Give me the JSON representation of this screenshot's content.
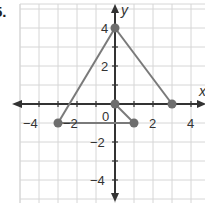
{
  "problem_number": "5.",
  "chart_data": {
    "type": "scatter",
    "title": "",
    "xlabel": "x",
    "ylabel": "y",
    "xlim": [
      -5,
      5
    ],
    "ylim": [
      -5,
      5
    ],
    "grid": true,
    "x_tick_labels": [
      "-4",
      "-2",
      "0",
      "2",
      "4"
    ],
    "y_tick_labels": [
      "4",
      "2",
      "-2",
      "-4"
    ],
    "points": [
      {
        "x": 0,
        "y": 4
      },
      {
        "x": 3,
        "y": 0
      },
      {
        "x": 0,
        "y": 0
      },
      {
        "x": -3,
        "y": -1
      },
      {
        "x": 1,
        "y": -1
      }
    ],
    "segments": [
      {
        "from": [
          0,
          4
        ],
        "to": [
          -3,
          -1
        ]
      },
      {
        "from": [
          0,
          4
        ],
        "to": [
          3,
          0
        ]
      },
      {
        "from": [
          -3,
          -1
        ],
        "to": [
          1,
          -1
        ]
      },
      {
        "from": [
          0,
          0
        ],
        "to": [
          1,
          -1
        ]
      }
    ],
    "colors": {
      "grid": "#d6d6d6",
      "axis": "#333333",
      "segment": "#7a7a7a",
      "point": "#6e6e6e"
    }
  },
  "labels": {
    "x_axis": "x",
    "y_axis": "y",
    "origin": "0",
    "x_neg4": "−4",
    "x_neg2": "−2",
    "x_2": "2",
    "x_4": "4",
    "y_4": "4",
    "y_2": "2",
    "y_neg2": "−2",
    "y_neg4": "−4"
  }
}
